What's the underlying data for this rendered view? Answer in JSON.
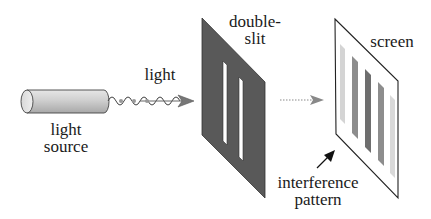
{
  "diagram": {
    "labels": {
      "light_source_line1": "light",
      "light_source_line2": "source",
      "light": "light",
      "double_slit_line1": "double-",
      "double_slit_line2": "slit",
      "screen": "screen",
      "interference_line1": "interference",
      "interference_line2": "pattern"
    },
    "components": [
      {
        "id": "light-source",
        "shape": "cylinder",
        "color": "#c8c8c8"
      },
      {
        "id": "light-wave",
        "shape": "sine-wave-arrow",
        "photon_dots": 3
      },
      {
        "id": "double-slit",
        "shape": "parallelogram",
        "color": "#555555",
        "slits": 2
      },
      {
        "id": "propagation-arrow",
        "shape": "dotted-arrow",
        "color": "#888888"
      },
      {
        "id": "screen",
        "shape": "parallelogram",
        "color": "#ffffff",
        "fringes": 5
      },
      {
        "id": "pattern-pointer",
        "shape": "arrow",
        "color": "#111111"
      }
    ],
    "fringe_intensities": [
      0.25,
      0.55,
      0.75,
      0.55,
      0.2
    ]
  }
}
